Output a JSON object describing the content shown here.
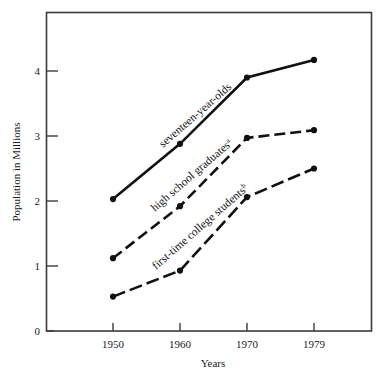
{
  "chart_data": {
    "type": "line",
    "title": "",
    "xlabel": "Years",
    "ylabel": "Population in Millions",
    "categories": [
      "1950",
      "1960",
      "1970",
      "1979"
    ],
    "x": [
      1950,
      1960,
      1970,
      1979
    ],
    "xlim": [
      1946,
      1984
    ],
    "ylim": [
      0,
      4.9
    ],
    "yticks": [
      "0",
      "1",
      "2",
      "3",
      "4"
    ],
    "ytick_values": [
      0,
      1,
      2,
      3,
      4
    ],
    "grid": false,
    "legend": "inline-labels-along-curves",
    "series": [
      {
        "name": "seventeen-year-olds",
        "label": "seventeen-year-olds",
        "superscript": "",
        "style": "solid",
        "marker": "filled-circle",
        "color": "#111111",
        "values": [
          2.03,
          2.88,
          3.9,
          4.17
        ]
      },
      {
        "name": "high school graduates",
        "label": "high school graduates",
        "superscript": "a",
        "style": "dashed",
        "marker": "filled-circle",
        "color": "#111111",
        "values": [
          1.12,
          1.92,
          2.97,
          3.09
        ]
      },
      {
        "name": "first-time college students",
        "label": "first-time college students",
        "superscript": "b",
        "style": "dash-dot",
        "marker": "filled-circle",
        "color": "#111111",
        "values": [
          0.53,
          0.93,
          2.06,
          2.5
        ]
      }
    ]
  },
  "axes": {
    "y_title": "Population in Millions",
    "x_title": "Years",
    "ytick_0": "0",
    "ytick_1": "1",
    "ytick_2": "2",
    "ytick_3": "3",
    "ytick_4": "4",
    "xtick_0": "1950",
    "xtick_1": "1960",
    "xtick_2": "1970",
    "xtick_3": "1979"
  },
  "labels": {
    "series1": "seventeen-year-olds",
    "series1_sup": "",
    "series2": "high school graduates",
    "series2_sup": "a",
    "series3": "first-time college students",
    "series3_sup": "b"
  },
  "colors": {
    "ink": "#111111",
    "frame": "#3a3a3a",
    "background": "#ffffff"
  }
}
